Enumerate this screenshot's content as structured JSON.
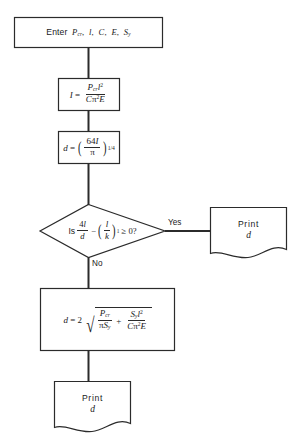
{
  "diagram": {
    "type": "flowchart",
    "nodes": [
      {
        "id": "input",
        "shape": "process",
        "label": "Enter P_cr, l, C, E, S_y",
        "text_plain": "Enter Pcr, l, C, E, Sy"
      },
      {
        "id": "compute-I",
        "shape": "process",
        "label": "I = P_cr l^2 / (C pi^2 E)",
        "text_plain": "I = Pcr l2 / C pi2 E"
      },
      {
        "id": "compute-d",
        "shape": "process",
        "label": "d = (64 I / pi)^(1/4)",
        "text_plain": "d = (64I/pi)^1/4"
      },
      {
        "id": "decision",
        "shape": "decision",
        "label": "Is 4l/d - (l/k)_1 >= 0?",
        "text_plain": "Is 4l/d - (l/k)1 >= 0?"
      },
      {
        "id": "print-right",
        "shape": "document",
        "label": "Print d",
        "text_plain": "Print d"
      },
      {
        "id": "compute-d2",
        "shape": "process",
        "label": "d = 2 sqrt( P_cr/(pi S_y) + S_y l^2/(C pi^2 E) )",
        "text_plain": "d = 2 sqrt(Pcr/pi Sy + Sy l2 / C pi2 E)"
      },
      {
        "id": "print-bottom",
        "shape": "document",
        "label": "Print d",
        "text_plain": "Print d"
      }
    ],
    "branch_labels": {
      "yes": "Yes",
      "no": "No"
    },
    "symbols": {
      "enter": "Enter",
      "is": "Is",
      "print": "Print",
      "d": "d",
      "I": "I",
      "l": "l",
      "k": "k",
      "C": "C",
      "E": "E",
      "P": "P",
      "S": "S",
      "sub_cr": "cr",
      "sub_y": "y",
      "sub_one": "1",
      "pi": "π",
      "equals": "=",
      "plus": "+",
      "minus": "−",
      "geq": "≥",
      "zero": "0",
      "question": "?",
      "comma": ",",
      "two": "2",
      "four": "4",
      "sixtyfour": "64",
      "exp_two": "2",
      "exp_quarter": "1/4",
      "radical": "√"
    },
    "colors": {
      "stroke": "#2b2b2b",
      "fill": "#ffffff",
      "text": "#1a1a1a"
    }
  }
}
